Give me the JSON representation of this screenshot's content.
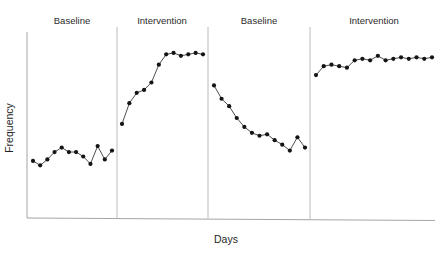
{
  "chart_data": {
    "type": "line",
    "title": "",
    "subtitle": "",
    "xlabel": "Days",
    "ylabel": "Frequency",
    "xlim": [
      0,
      56
    ],
    "ylim": [
      0,
      100
    ],
    "grid": false,
    "legend": "none",
    "axis_ticks": {
      "x_tick_labels": [],
      "y_tick_labels": []
    },
    "annotations": [
      {
        "text": "Baseline",
        "phase_index": 0
      },
      {
        "text": "Intervention",
        "phase_index": 1
      },
      {
        "text": "Baseline",
        "phase_index": 2
      },
      {
        "text": "Intervention",
        "phase_index": 3
      }
    ],
    "phase_dividers_x": [
      13.0,
      24.0,
      36.0
    ],
    "phases": [
      {
        "name": "Baseline",
        "label": "Baseline",
        "condition": "baseline",
        "x": [
          1,
          2,
          3,
          4,
          5,
          6,
          7,
          8,
          9,
          10,
          11
        ],
        "values": [
          21,
          18,
          22,
          27,
          30,
          27,
          27,
          24,
          19,
          31,
          22,
          28
        ]
      },
      {
        "name": "Intervention",
        "label": "Intervention",
        "condition": "intervention",
        "x": [
          14,
          15,
          16,
          17,
          18,
          19,
          20,
          21,
          22,
          23,
          24,
          25
        ],
        "values": [
          46,
          60,
          67,
          69,
          74,
          86,
          93,
          94,
          92,
          93,
          94,
          93
        ]
      },
      {
        "name": "Baseline",
        "label": "Baseline",
        "condition": "baseline",
        "x": [
          26,
          27,
          28,
          29,
          30,
          31,
          32,
          33,
          34,
          35,
          36,
          37,
          38
        ],
        "values": [
          72,
          63,
          58,
          50,
          44,
          40,
          38,
          39,
          35,
          32,
          28,
          37,
          30
        ]
      },
      {
        "name": "Intervention",
        "label": "Intervention",
        "condition": "intervention",
        "x": [
          39,
          40,
          41,
          42,
          43,
          44,
          45,
          46,
          47,
          48,
          49,
          50,
          51,
          52,
          53,
          54
        ],
        "values": [
          79,
          85,
          86,
          85,
          84,
          89,
          90,
          89,
          92,
          89,
          90,
          91,
          90,
          91,
          90,
          91
        ]
      }
    ]
  },
  "axes": {
    "y_label": "Frequency",
    "x_label": "Days"
  },
  "colors": {
    "line": "#3a3a3a",
    "marker": "#141414",
    "axis": "#9a9a9a",
    "divider": "#b4b4b4",
    "text": "#1f1f1f",
    "background": "#ffffff"
  }
}
